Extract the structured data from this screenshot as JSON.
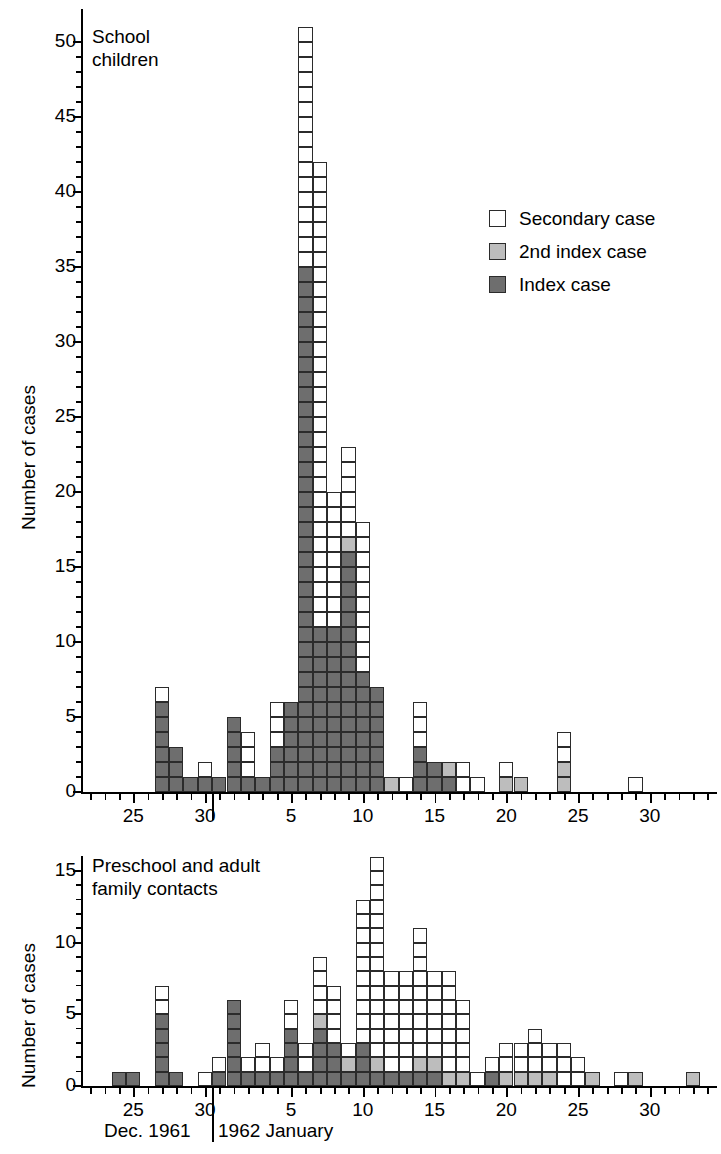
{
  "chart_data": {
    "type": "bar",
    "title": "",
    "subtype": "stacked unit-square epidemic curve",
    "xlabel": "Dec. 1961 | 1962 January",
    "ylabel": "Number of cases",
    "series_names": [
      "Secondary case",
      "2nd index case",
      "Index case"
    ],
    "series_colors": {
      "secondary": "#ffffff",
      "second_index": "#bdbdbd",
      "index": "#6e6e6e"
    },
    "legend": {
      "position": "upper-right",
      "entries": [
        {
          "key": "secondary",
          "label": "Secondary case"
        },
        {
          "key": "second_index",
          "label": "2nd index case"
        },
        {
          "key": "index",
          "label": "Index case"
        }
      ]
    },
    "month_caption": {
      "left": "Dec. 1961",
      "right": "1962 January"
    },
    "panels": [
      {
        "id": "school-children",
        "title": "School\nchildren",
        "ylabel": "Number of cases",
        "ylim": [
          0,
          52
        ],
        "yticks": [
          0,
          5,
          10,
          15,
          20,
          25,
          30,
          35,
          40,
          45,
          50
        ],
        "ytick_labels": [
          "0",
          "5",
          "10",
          "15",
          "20",
          "25",
          "30",
          "35",
          "40",
          "45",
          "50"
        ],
        "xticks_labeled": [
          25,
          30,
          5,
          10,
          15,
          20,
          25,
          30
        ],
        "xtick_labels": [
          "25",
          "30",
          "5",
          "10",
          "15",
          "20",
          "25",
          "30"
        ],
        "xlim_days": [
          22,
          56
        ],
        "bars": [
          {
            "day": 22,
            "label": "Dec 22",
            "index": 0,
            "second_index": 0,
            "secondary": 0,
            "total": 0
          },
          {
            "day": 23,
            "label": "Dec 23",
            "index": 0,
            "second_index": 0,
            "secondary": 0,
            "total": 0
          },
          {
            "day": 24,
            "label": "Dec 24",
            "index": 0,
            "second_index": 0,
            "secondary": 0,
            "total": 0
          },
          {
            "day": 25,
            "label": "Dec 25",
            "index": 0,
            "second_index": 0,
            "secondary": 0,
            "total": 0
          },
          {
            "day": 26,
            "label": "Dec 26",
            "index": 0,
            "second_index": 0,
            "secondary": 0,
            "total": 0
          },
          {
            "day": 27,
            "label": "Dec 27",
            "index": 6,
            "second_index": 0,
            "secondary": 1,
            "total": 7
          },
          {
            "day": 28,
            "label": "Dec 28",
            "index": 3,
            "second_index": 0,
            "secondary": 0,
            "total": 3
          },
          {
            "day": 29,
            "label": "Dec 29",
            "index": 1,
            "second_index": 0,
            "secondary": 0,
            "total": 1
          },
          {
            "day": 30,
            "label": "Dec 30",
            "index": 1,
            "second_index": 0,
            "secondary": 1,
            "total": 2
          },
          {
            "day": 31,
            "label": "Dec 31",
            "index": 1,
            "second_index": 0,
            "secondary": 0,
            "total": 1
          },
          {
            "day": 32,
            "label": "Jan 1",
            "index": 5,
            "second_index": 0,
            "secondary": 0,
            "total": 5
          },
          {
            "day": 33,
            "label": "Jan 2",
            "index": 1,
            "second_index": 0,
            "secondary": 3,
            "total": 4
          },
          {
            "day": 34,
            "label": "Jan 3",
            "index": 1,
            "second_index": 0,
            "secondary": 0,
            "total": 1
          },
          {
            "day": 35,
            "label": "Jan 4",
            "index": 3,
            "second_index": 0,
            "secondary": 3,
            "total": 6
          },
          {
            "day": 36,
            "label": "Jan 5",
            "index": 6,
            "second_index": 0,
            "secondary": 0,
            "total": 6
          },
          {
            "day": 37,
            "label": "Jan 6",
            "index": 35,
            "second_index": 0,
            "secondary": 16,
            "total": 51
          },
          {
            "day": 38,
            "label": "Jan 7",
            "index": 11,
            "second_index": 0,
            "secondary": 31,
            "total": 42
          },
          {
            "day": 39,
            "label": "Jan 8",
            "index": 11,
            "second_index": 0,
            "secondary": 9,
            "total": 20
          },
          {
            "day": 40,
            "label": "Jan 9",
            "index": 16,
            "second_index": 1,
            "secondary": 6,
            "total": 23
          },
          {
            "day": 41,
            "label": "Jan 10",
            "index": 8,
            "second_index": 0,
            "secondary": 10,
            "total": 18
          },
          {
            "day": 42,
            "label": "Jan 11",
            "index": 7,
            "second_index": 0,
            "secondary": 0,
            "total": 7
          },
          {
            "day": 43,
            "label": "Jan 12",
            "index": 0,
            "second_index": 1,
            "secondary": 0,
            "total": 1
          },
          {
            "day": 44,
            "label": "Jan 13",
            "index": 0,
            "second_index": 0,
            "secondary": 1,
            "total": 1
          },
          {
            "day": 45,
            "label": "Jan 14",
            "index": 3,
            "second_index": 0,
            "secondary": 3,
            "total": 6
          },
          {
            "day": 46,
            "label": "Jan 15",
            "index": 2,
            "second_index": 0,
            "secondary": 0,
            "total": 2
          },
          {
            "day": 47,
            "label": "Jan 16",
            "index": 1,
            "second_index": 1,
            "secondary": 0,
            "total": 2
          },
          {
            "day": 48,
            "label": "Jan 17",
            "index": 0,
            "second_index": 0,
            "secondary": 2,
            "total": 2
          },
          {
            "day": 49,
            "label": "Jan 18",
            "index": 0,
            "second_index": 0,
            "secondary": 1,
            "total": 1
          },
          {
            "day": 50,
            "label": "Jan 19",
            "index": 0,
            "second_index": 0,
            "secondary": 0,
            "total": 0
          },
          {
            "day": 51,
            "label": "Jan 20",
            "index": 0,
            "second_index": 1,
            "secondary": 1,
            "total": 2
          },
          {
            "day": 52,
            "label": "Jan 21",
            "index": 0,
            "second_index": 1,
            "secondary": 0,
            "total": 1
          },
          {
            "day": 53,
            "label": "Jan 22",
            "index": 0,
            "second_index": 0,
            "secondary": 0,
            "total": 0
          },
          {
            "day": 54,
            "label": "Jan 23",
            "index": 0,
            "second_index": 0,
            "secondary": 0,
            "total": 0
          },
          {
            "day": 55,
            "label": "Jan 24",
            "index": 0,
            "second_index": 2,
            "secondary": 2,
            "total": 4
          },
          {
            "day": 56,
            "label": "Jan 25",
            "index": 0,
            "second_index": 0,
            "secondary": 0,
            "total": 0
          },
          {
            "day": 57,
            "label": "Jan 26",
            "index": 0,
            "second_index": 0,
            "secondary": 0,
            "total": 0
          },
          {
            "day": 58,
            "label": "Jan 27",
            "index": 0,
            "second_index": 0,
            "secondary": 0,
            "total": 0
          },
          {
            "day": 59,
            "label": "Jan 28",
            "index": 0,
            "second_index": 0,
            "secondary": 0,
            "total": 0
          },
          {
            "day": 60,
            "label": "Jan 29",
            "index": 0,
            "second_index": 0,
            "secondary": 1,
            "total": 1
          },
          {
            "day": 61,
            "label": "Jan 30",
            "index": 0,
            "second_index": 0,
            "secondary": 0,
            "total": 0
          },
          {
            "day": 62,
            "label": "Jan 31",
            "index": 0,
            "second_index": 0,
            "secondary": 0,
            "total": 0
          },
          {
            "day": 63,
            "label": "Feb 1",
            "index": 0,
            "second_index": 0,
            "secondary": 0,
            "total": 0
          },
          {
            "day": 64,
            "label": "Feb 2",
            "index": 0,
            "second_index": 0,
            "secondary": 0,
            "total": 0
          },
          {
            "day": 65,
            "label": "Feb 3",
            "index": 0,
            "second_index": 0,
            "secondary": 0,
            "total": 0
          }
        ]
      },
      {
        "id": "preschool-adult-family-contacts",
        "title": "Preschool and adult\nfamily contacts",
        "ylabel": "Number of cases",
        "ylim": [
          0,
          17
        ],
        "yticks": [
          0,
          5,
          10,
          15
        ],
        "ytick_labels": [
          "0",
          "5",
          "10",
          "15"
        ],
        "xticks_labeled": [
          25,
          30,
          5,
          10,
          15,
          20,
          25,
          30
        ],
        "xtick_labels": [
          "25",
          "30",
          "5",
          "10",
          "15",
          "20",
          "25",
          "30"
        ],
        "xlim_days": [
          22,
          56
        ],
        "bars": [
          {
            "day": 22,
            "label": "Dec 22",
            "index": 0,
            "second_index": 0,
            "secondary": 0,
            "total": 0
          },
          {
            "day": 23,
            "label": "Dec 23",
            "index": 0,
            "second_index": 0,
            "secondary": 0,
            "total": 0
          },
          {
            "day": 24,
            "label": "Dec 24",
            "index": 1,
            "second_index": 0,
            "secondary": 0,
            "total": 1
          },
          {
            "day": 25,
            "label": "Dec 25",
            "index": 1,
            "second_index": 0,
            "secondary": 0,
            "total": 1
          },
          {
            "day": 26,
            "label": "Dec 26",
            "index": 0,
            "second_index": 0,
            "secondary": 0,
            "total": 0
          },
          {
            "day": 27,
            "label": "Dec 27",
            "index": 5,
            "second_index": 0,
            "secondary": 2,
            "total": 7
          },
          {
            "day": 28,
            "label": "Dec 28",
            "index": 1,
            "second_index": 0,
            "secondary": 0,
            "total": 1
          },
          {
            "day": 29,
            "label": "Dec 29",
            "index": 0,
            "second_index": 0,
            "secondary": 0,
            "total": 0
          },
          {
            "day": 30,
            "label": "Dec 30",
            "index": 0,
            "second_index": 0,
            "secondary": 1,
            "total": 1
          },
          {
            "day": 31,
            "label": "Dec 31",
            "index": 1,
            "second_index": 0,
            "secondary": 1,
            "total": 2
          },
          {
            "day": 32,
            "label": "Jan 1",
            "index": 6,
            "second_index": 0,
            "secondary": 0,
            "total": 6
          },
          {
            "day": 33,
            "label": "Jan 2",
            "index": 1,
            "second_index": 0,
            "secondary": 1,
            "total": 2
          },
          {
            "day": 34,
            "label": "Jan 3",
            "index": 1,
            "second_index": 0,
            "secondary": 2,
            "total": 3
          },
          {
            "day": 35,
            "label": "Jan 4",
            "index": 1,
            "second_index": 0,
            "secondary": 1,
            "total": 2
          },
          {
            "day": 36,
            "label": "Jan 5",
            "index": 4,
            "second_index": 0,
            "secondary": 2,
            "total": 6
          },
          {
            "day": 37,
            "label": "Jan 6",
            "index": 1,
            "second_index": 0,
            "secondary": 2,
            "total": 3
          },
          {
            "day": 38,
            "label": "Jan 7",
            "index": 4,
            "second_index": 1,
            "secondary": 4,
            "total": 9
          },
          {
            "day": 39,
            "label": "Jan 8",
            "index": 3,
            "second_index": 0,
            "secondary": 4,
            "total": 7
          },
          {
            "day": 40,
            "label": "Jan 9",
            "index": 1,
            "second_index": 1,
            "secondary": 1,
            "total": 3
          },
          {
            "day": 41,
            "label": "Jan 10",
            "index": 3,
            "second_index": 0,
            "secondary": 10,
            "total": 13
          },
          {
            "day": 42,
            "label": "Jan 11",
            "index": 1,
            "second_index": 1,
            "secondary": 14,
            "total": 16
          },
          {
            "day": 43,
            "label": "Jan 12",
            "index": 1,
            "second_index": 0,
            "secondary": 7,
            "total": 8
          },
          {
            "day": 44,
            "label": "Jan 13",
            "index": 1,
            "second_index": 0,
            "secondary": 7,
            "total": 8
          },
          {
            "day": 45,
            "label": "Jan 14",
            "index": 1,
            "second_index": 1,
            "secondary": 9,
            "total": 11
          },
          {
            "day": 46,
            "label": "Jan 15",
            "index": 1,
            "second_index": 1,
            "secondary": 6,
            "total": 8
          },
          {
            "day": 47,
            "label": "Jan 16",
            "index": 0,
            "second_index": 1,
            "secondary": 7,
            "total": 8
          },
          {
            "day": 48,
            "label": "Jan 17",
            "index": 0,
            "second_index": 1,
            "secondary": 5,
            "total": 6
          },
          {
            "day": 49,
            "label": "Jan 18",
            "index": 0,
            "second_index": 0,
            "secondary": 1,
            "total": 1
          },
          {
            "day": 50,
            "label": "Jan 19",
            "index": 1,
            "second_index": 0,
            "secondary": 1,
            "total": 2
          },
          {
            "day": 51,
            "label": "Jan 20",
            "index": 0,
            "second_index": 1,
            "secondary": 2,
            "total": 3
          },
          {
            "day": 52,
            "label": "Jan 21",
            "index": 0,
            "second_index": 1,
            "secondary": 2,
            "total": 3
          },
          {
            "day": 53,
            "label": "Jan 22",
            "index": 0,
            "second_index": 1,
            "secondary": 3,
            "total": 4
          },
          {
            "day": 54,
            "label": "Jan 23",
            "index": 0,
            "second_index": 1,
            "secondary": 2,
            "total": 3
          },
          {
            "day": 55,
            "label": "Jan 24",
            "index": 0,
            "second_index": 0,
            "secondary": 3,
            "total": 3
          },
          {
            "day": 56,
            "label": "Jan 25",
            "index": 0,
            "second_index": 0,
            "secondary": 2,
            "total": 2
          },
          {
            "day": 57,
            "label": "Jan 26",
            "index": 0,
            "second_index": 1,
            "secondary": 0,
            "total": 1
          },
          {
            "day": 58,
            "label": "Jan 27",
            "index": 0,
            "second_index": 0,
            "secondary": 0,
            "total": 0
          },
          {
            "day": 59,
            "label": "Jan 28",
            "index": 0,
            "second_index": 0,
            "secondary": 1,
            "total": 1
          },
          {
            "day": 60,
            "label": "Jan 29",
            "index": 0,
            "second_index": 1,
            "secondary": 0,
            "total": 1
          },
          {
            "day": 61,
            "label": "Jan 30",
            "index": 0,
            "second_index": 0,
            "secondary": 0,
            "total": 0
          },
          {
            "day": 62,
            "label": "Jan 31",
            "index": 0,
            "second_index": 0,
            "secondary": 0,
            "total": 0
          },
          {
            "day": 63,
            "label": "Feb 1",
            "index": 0,
            "second_index": 0,
            "secondary": 0,
            "total": 0
          },
          {
            "day": 64,
            "label": "Feb 2",
            "index": 0,
            "second_index": 1,
            "secondary": 0,
            "total": 1
          },
          {
            "day": 65,
            "label": "Feb 3",
            "index": 0,
            "second_index": 0,
            "secondary": 0,
            "total": 0
          }
        ]
      }
    ]
  }
}
